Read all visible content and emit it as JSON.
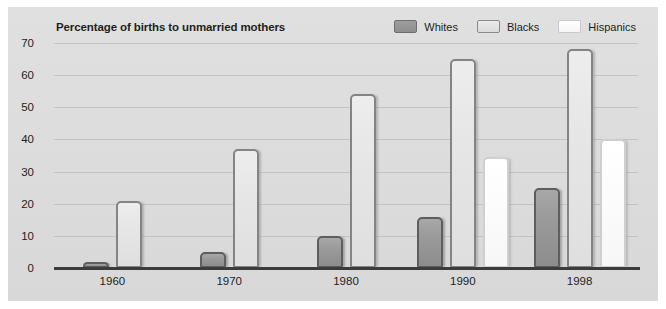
{
  "chart_data": {
    "type": "bar",
    "title": "Percentage of births to unmarried mothers",
    "xlabel": "",
    "ylabel": "",
    "ylim": [
      0,
      70
    ],
    "ytick_step": 10,
    "yticks": [
      "0",
      "10",
      "20",
      "30",
      "40",
      "50",
      "60",
      "70"
    ],
    "grid": true,
    "legend_position": "top-right",
    "categories": [
      "1960",
      "1970",
      "1980",
      "1990",
      "1998"
    ],
    "series": [
      {
        "name": "Whites",
        "color": "#9b9b9b",
        "values": [
          2,
          5,
          10,
          16,
          25
        ]
      },
      {
        "name": "Blacks",
        "color": "#e6e6e6",
        "values": [
          21,
          37,
          54,
          65,
          68
        ]
      },
      {
        "name": "Hispanics",
        "color": "#ffffff",
        "values": [
          null,
          null,
          null,
          34.5,
          40
        ]
      }
    ]
  },
  "legend": {
    "items": [
      {
        "label": "Whites",
        "swatch": "whites"
      },
      {
        "label": "Blacks",
        "swatch": "blacks"
      },
      {
        "label": "Hispanics",
        "swatch": "hispanics"
      }
    ]
  },
  "colors": {
    "panel_background": "#dcdcdc",
    "gridline": "#c2c2c2",
    "axis": "#3c3c3c",
    "text": "#231f20"
  }
}
